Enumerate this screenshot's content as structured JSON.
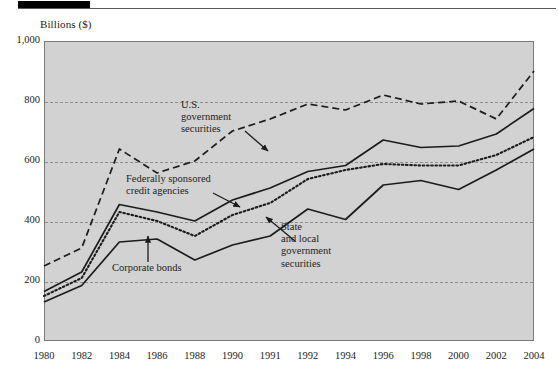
{
  "figure": {
    "y_axis_unit_label": "Billions ($)"
  },
  "chart_data": {
    "type": "line",
    "title": "",
    "xlabel": "",
    "ylabel": "Billions ($)",
    "ylim": [
      0,
      1000
    ],
    "y_ticks": [
      0,
      200,
      400,
      600,
      800,
      1000
    ],
    "y_tick_labels": [
      "0",
      "200",
      "400",
      "600",
      "800",
      "1,000"
    ],
    "grid": true,
    "gridlines_at": [
      200,
      400,
      600,
      800
    ],
    "legend_position": "inline-annotations",
    "x_tick_labels": [
      "1980",
      "1982",
      "1984",
      "1986",
      "1988",
      "1990",
      "1991",
      "1992",
      "1994",
      "1996",
      "1998",
      "2000",
      "2002",
      "2004"
    ],
    "x": [
      1980,
      1982,
      1984,
      1986,
      1988,
      1990,
      1991,
      1992,
      1994,
      1996,
      1998,
      2000,
      2002,
      2004
    ],
    "series": [
      {
        "name": "U.S. government securities",
        "style": "dashed",
        "color": "#1c1c1c",
        "values": [
          250,
          310,
          640,
          560,
          600,
          700,
          740,
          790,
          770,
          820,
          790,
          800,
          740,
          900
        ]
      },
      {
        "name": "Federally sponsored credit agencies",
        "style": "solid",
        "color": "#1c1c1c",
        "values": [
          165,
          230,
          455,
          430,
          400,
          470,
          510,
          565,
          585,
          670,
          645,
          650,
          690,
          775
        ]
      },
      {
        "name": "State and local government securities",
        "style": "dotted",
        "color": "#1c1c1c",
        "values": [
          150,
          210,
          430,
          400,
          350,
          420,
          460,
          540,
          570,
          590,
          585,
          585,
          620,
          680
        ]
      },
      {
        "name": "Corporate bonds",
        "style": "solid",
        "color": "#1c1c1c",
        "values": [
          130,
          185,
          330,
          340,
          270,
          320,
          350,
          440,
          405,
          520,
          535,
          505,
          570,
          640
        ]
      }
    ],
    "annotations": [
      {
        "id": "us-gov",
        "text": "U.S.\ngovernment\nsecurities",
        "points_to_series": "U.S. government securities"
      },
      {
        "id": "federal",
        "text": "Federally sponsored\ncredit agencies",
        "points_to_series": "Federally sponsored credit agencies"
      },
      {
        "id": "state-local",
        "text": "State\nand local\ngovernment\nsecurities",
        "points_to_series": "State and local government securities"
      },
      {
        "id": "corporate",
        "text": "Corporate bonds",
        "points_to_series": "Corporate bonds"
      }
    ]
  }
}
